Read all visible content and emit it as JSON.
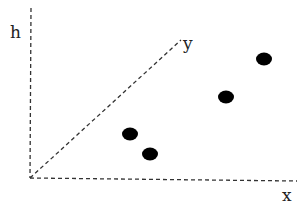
{
  "diagram": {
    "axes": {
      "h_label": "h",
      "x_label": "x",
      "y_label": "y",
      "style": "dashed",
      "color": "#333333"
    },
    "points": [
      {
        "x": 130,
        "y": 134
      },
      {
        "x": 150,
        "y": 154
      },
      {
        "x": 226,
        "y": 97
      },
      {
        "x": 264,
        "y": 59
      }
    ],
    "point_color": "#000000"
  }
}
